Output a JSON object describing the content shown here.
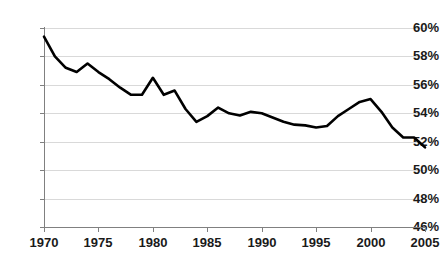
{
  "chart_data": {
    "type": "line",
    "title": "",
    "subtitle": "",
    "xlabel": "",
    "ylabel": "",
    "xlim": [
      1970,
      2005
    ],
    "ylim": [
      46,
      60
    ],
    "grid": true,
    "legend": null,
    "y_tick_labels": [
      "60%",
      "58%",
      "56%",
      "54%",
      "52%",
      "50%",
      "48%",
      "46%"
    ],
    "y_ticks": [
      60,
      58,
      56,
      54,
      52,
      50,
      48,
      46
    ],
    "x_tick_labels": [
      "1970",
      "1975",
      "1980",
      "1985",
      "1990",
      "1995",
      "2000",
      "2005"
    ],
    "x_ticks": [
      1970,
      1975,
      1980,
      1985,
      1990,
      1995,
      2000,
      2005
    ],
    "x": [
      1970,
      1971,
      1972,
      1973,
      1974,
      1975,
      1976,
      1977,
      1978,
      1979,
      1980,
      1981,
      1982,
      1983,
      1984,
      1985,
      1986,
      1987,
      1988,
      1989,
      1990,
      1991,
      1992,
      1993,
      1994,
      1995,
      1996,
      1997,
      1998,
      1999,
      2000,
      2001,
      2002,
      2003,
      2004,
      2005
    ],
    "values": [
      59.4,
      58.0,
      57.2,
      56.9,
      57.5,
      56.9,
      56.4,
      55.8,
      55.3,
      55.3,
      56.5,
      55.3,
      55.6,
      54.3,
      53.4,
      53.8,
      54.4,
      54.0,
      53.85,
      54.1,
      54.0,
      53.7,
      53.4,
      53.2,
      53.15,
      53.0,
      53.1,
      53.8,
      54.3,
      54.8,
      55.0,
      54.1,
      53.0,
      52.3,
      52.3,
      51.6
    ],
    "series_name": "",
    "line_color": "#000000",
    "grid_color": "#d9d9d9",
    "axis_color": "#808080",
    "text_color": "#1a1a1a"
  }
}
